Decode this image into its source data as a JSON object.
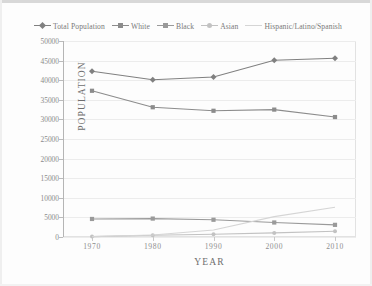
{
  "chart_data": {
    "type": "line",
    "title": "",
    "xlabel": "YEAR",
    "ylabel": "POPULATION",
    "x": [
      1970,
      1980,
      1990,
      2000,
      2010
    ],
    "categories": [
      "1970",
      "1980",
      "1990",
      "2000",
      "2010"
    ],
    "xlim": [
      1965,
      2015
    ],
    "ylim": [
      0,
      50000
    ],
    "ytick_labels": [
      "50000",
      "45000",
      "40000",
      "35000",
      "30000",
      "25000",
      "20000",
      "15000",
      "10000",
      "5000",
      "0"
    ],
    "ytick_values": [
      50000,
      45000,
      40000,
      35000,
      30000,
      25000,
      20000,
      15000,
      10000,
      5000,
      0
    ],
    "grid": true,
    "legend_position": "top",
    "series": [
      {
        "name": "Total Population",
        "values": [
          42300,
          40100,
          40800,
          45100,
          45600
        ],
        "color": "#808080",
        "marker": "diamond"
      },
      {
        "name": "White",
        "values": [
          37300,
          33100,
          32200,
          32500,
          30600
        ],
        "color": "#8c8c8c",
        "marker": "square"
      },
      {
        "name": "Black",
        "values": [
          4600,
          4700,
          4400,
          3700,
          3100
        ],
        "color": "#9a9a9a",
        "marker": "square"
      },
      {
        "name": "Asian",
        "values": [
          100,
          450,
          700,
          1050,
          1450
        ],
        "color": "#c2c2c2",
        "marker": "round"
      },
      {
        "name": "Hispanic/Latino/Spanish",
        "values": [
          100,
          500,
          1800,
          5200,
          7600
        ],
        "color": "#d5d5d5",
        "marker": "none"
      }
    ]
  }
}
